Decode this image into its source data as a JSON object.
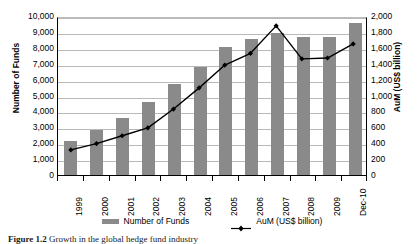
{
  "figure": {
    "caption_label": "Figure 1.2",
    "caption_text": "Growth in the global hedge fund industry"
  },
  "chart_data": {
    "type": "bar",
    "title": "",
    "categories": [
      "1999",
      "2000",
      "2001",
      "2002",
      "2003",
      "2004",
      "2005",
      "2006",
      "2007",
      "2008",
      "2009",
      "Dec-10"
    ],
    "series": [
      {
        "name": "Number of Funds",
        "type": "bar",
        "axis": "left",
        "color": "#8a8a8a",
        "values": [
          2150,
          2850,
          3600,
          4600,
          5700,
          6800,
          8050,
          8550,
          8950,
          8650,
          8650,
          9550
        ]
      },
      {
        "name": "AuM (US$ billion)",
        "type": "line",
        "axis": "right",
        "color": "#000000",
        "marker": "diamond",
        "values": [
          320,
          400,
          500,
          600,
          840,
          1110,
          1400,
          1550,
          1900,
          1480,
          1490,
          1670
        ]
      }
    ],
    "xlabel": "",
    "ylabel": "Number of Funds",
    "y2label": "AuM (US$ billion)",
    "ylim": [
      0,
      10000
    ],
    "y2lim": [
      0,
      2000
    ],
    "yticks": [
      "0",
      "1,000",
      "2,000",
      "3,000",
      "4,000",
      "5,000",
      "6,000",
      "7,000",
      "8,000",
      "9,000",
      "10,000"
    ],
    "ytick_values": [
      0,
      1000,
      2000,
      3000,
      4000,
      5000,
      6000,
      7000,
      8000,
      9000,
      10000
    ],
    "y2ticks": [
      "0",
      "200",
      "400",
      "600",
      "800",
      "1,000",
      "1,200",
      "1,400",
      "1,600",
      "1,800",
      "2,000"
    ],
    "y2tick_values": [
      0,
      200,
      400,
      600,
      800,
      1000,
      1200,
      1400,
      1600,
      1800,
      2000
    ],
    "grid": true,
    "legend_position": "bottom",
    "legend": [
      "Number of Funds",
      "AuM (US$ billion)"
    ]
  }
}
